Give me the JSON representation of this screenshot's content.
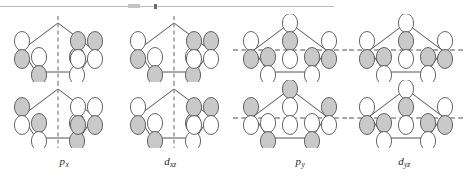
{
  "figure": {
    "width": 464,
    "height": 178,
    "background": "#ffffff",
    "colors": {
      "lobe_stroke": "#555555",
      "lobe_shaded_fill": "#c9c9c9",
      "lobe_empty_fill": "#ffffff",
      "ring_bond_stroke": "#3f3f3f",
      "node_dash_stroke": "#8a8a8a",
      "label_text": "#262626",
      "artifact_line": "#9a9a9a"
    },
    "artifact": {
      "name": "scan-edge-line",
      "description": "thin horizontal scan artifact line across the top-left of the page"
    }
  },
  "grid": {
    "rows": 2,
    "columns": 4,
    "panel_width": 116,
    "panel_height": 68
  },
  "panels": [
    {
      "id": "px-top",
      "column": 0,
      "row": 0,
      "node_plane": "vertical",
      "node_plane_label": "vertical mirror / nodal plane",
      "lobe_signs": [
        "+-",
        "-+",
        "-+",
        "+-",
        "+-"
      ],
      "shaded_top": [
        false,
        true,
        true,
        false,
        false
      ]
    },
    {
      "id": "dxz-top",
      "column": 1,
      "row": 0,
      "node_plane": "vertical",
      "node_plane_label": "vertical mirror / nodal plane",
      "lobe_signs": [
        "+-",
        "-+",
        "+-",
        "-+",
        "-+"
      ],
      "shaded_top": [
        false,
        true,
        false,
        true,
        true
      ]
    },
    {
      "id": "py-top",
      "column": 2,
      "row": 0,
      "node_plane": "horizontal",
      "node_plane_label": "horizontal mirror / nodal plane",
      "lobe_signs": [
        "-+",
        "-+",
        "-+",
        "-+",
        "-+"
      ],
      "shaded_top": [
        true,
        true,
        true,
        true,
        true
      ]
    },
    {
      "id": "dyz-top",
      "column": 3,
      "row": 0,
      "node_plane": "horizontal",
      "node_plane_label": "horizontal mirror / nodal plane",
      "lobe_signs": [
        "-+",
        "-+",
        "-+",
        "-+",
        "-+"
      ],
      "shaded_top": [
        true,
        true,
        true,
        true,
        true
      ]
    },
    {
      "id": "px-bottom",
      "column": 0,
      "row": 1,
      "node_plane": "vertical",
      "node_plane_label": "vertical mirror / nodal plane",
      "lobe_signs": [
        "-+",
        "+-",
        "+-",
        "-+",
        "-+"
      ],
      "shaded_top": [
        true,
        false,
        false,
        true,
        true
      ]
    },
    {
      "id": "dxz-bottom",
      "column": 1,
      "row": 1,
      "node_plane": "vertical",
      "node_plane_label": "vertical mirror / nodal plane",
      "lobe_signs": [
        "+-",
        "-+",
        "-+",
        "+-",
        "+-"
      ],
      "shaded_top": [
        false,
        true,
        true,
        false,
        false
      ]
    },
    {
      "id": "py-bottom",
      "column": 2,
      "row": 1,
      "node_plane": "horizontal",
      "node_plane_label": "horizontal mirror / nodal plane",
      "lobe_signs": [
        "-+",
        "-+",
        "+-",
        "-+",
        "-+"
      ],
      "shaded_top": [
        true,
        true,
        false,
        true,
        true
      ]
    },
    {
      "id": "dyz-bottom",
      "column": 3,
      "row": 1,
      "node_plane": "horizontal",
      "node_plane_label": "horizontal mirror / nodal plane",
      "lobe_signs": [
        "+-",
        "-+",
        "-+",
        "+-",
        "-+"
      ],
      "shaded_top": [
        false,
        true,
        true,
        false,
        true
      ]
    }
  ],
  "labels": [
    {
      "id": "label-px",
      "base": "p",
      "sub": "x",
      "text": "px",
      "x": 64,
      "column": 0
    },
    {
      "id": "label-dxz",
      "base": "d",
      "sub": "xz",
      "text": "dxz",
      "x": 170,
      "column": 1
    },
    {
      "id": "label-py",
      "base": "p",
      "sub": "y",
      "text": "py",
      "x": 300,
      "column": 2
    },
    {
      "id": "label-dyz",
      "base": "d",
      "sub": "yz",
      "text": "dyz",
      "x": 404,
      "column": 3
    }
  ]
}
